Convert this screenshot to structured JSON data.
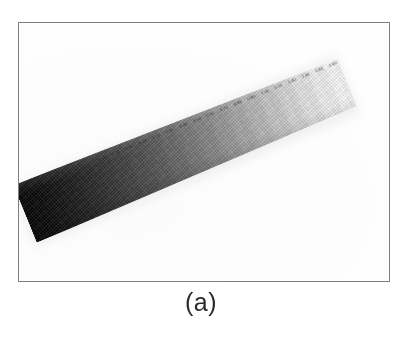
{
  "figure": {
    "caption": "(a)",
    "frame": {
      "border_color": "#7d7d7d",
      "background_color": "#ffffff"
    },
    "photo": {
      "description": "photographed grayscale step-wedge calibration strip, tilted diagonally",
      "background_color": "#fefefe",
      "strip": {
        "rotation_degrees": -22.2,
        "dark_end_color": "#050505",
        "light_end_color": "#fcfcfc",
        "gradient_direction": "dark-lower-left-to-light-upper-right"
      }
    },
    "strip_labels": [
      "0.05",
      "0.10",
      "0.15",
      "0.20",
      "0.25",
      "0.30",
      "0.40",
      "0.50",
      "0.60",
      "0.70",
      "0.80",
      "0.90",
      "1.00",
      "1.20",
      "1.40",
      "1.60",
      "1.80",
      "2.00"
    ]
  },
  "chart_data": {
    "type": "heatmap",
    "title": "(a)",
    "xlabel": "",
    "ylabel": "",
    "orientation": "diagonal",
    "rotation_degrees": -22.2,
    "categories": [
      "step-01",
      "step-02",
      "step-03",
      "step-04",
      "step-05",
      "step-06",
      "step-07",
      "step-08",
      "step-09",
      "step-10",
      "step-11",
      "step-12",
      "step-13",
      "step-14",
      "step-15",
      "step-16",
      "step-17",
      "step-18",
      "step-19",
      "step-20",
      "step-21"
    ],
    "values": [
      5,
      10,
      19,
      29,
      40,
      51,
      63,
      75,
      87,
      101,
      115,
      130,
      145,
      161,
      176,
      192,
      207,
      222,
      235,
      245,
      252
    ],
    "value_unit": "8-bit gray level",
    "ylim": [
      0,
      255
    ],
    "colors": [
      "#050505",
      "#0a0a0a",
      "#131313",
      "#1d1d1d",
      "#282828",
      "#333333",
      "#3f3f3f",
      "#4b4b4b",
      "#575757",
      "#656565",
      "#737373",
      "#828282",
      "#919191",
      "#a1a1a1",
      "#b0b0b0",
      "#c0c0c0",
      "#cfcfcf",
      "#dedede",
      "#ebebeb",
      "#f5f5f5",
      "#fcfcfc"
    ],
    "grid": false,
    "legend": "none"
  }
}
